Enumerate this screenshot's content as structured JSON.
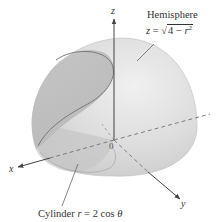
{
  "figure": {
    "axes": {
      "x_label": "x",
      "y_label": "y",
      "z_label": "z",
      "origin_label": "0"
    },
    "hemisphere": {
      "title": "Hemisphere",
      "eq_lhs": "z",
      "eq_op": " = ",
      "eq_sqrt_sign": "√",
      "eq_radicand_num": "4 − ",
      "eq_radicand_var": "r",
      "eq_radicand_exp": "2"
    },
    "cylinder": {
      "label_prefix": "Cylinder ",
      "label_var": "r",
      "label_eq": " = 2 cos ",
      "label_theta": "θ"
    },
    "colors": {
      "hemisphere_fill": "#d9d9d9",
      "hemisphere_light": "#ececec",
      "cylinder_fill": "#bdbdbd",
      "curve": "#7a7a7a",
      "axis": "#444444",
      "text": "#333333"
    }
  }
}
